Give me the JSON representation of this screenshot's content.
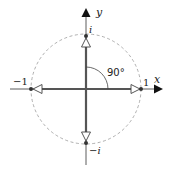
{
  "diagram": {
    "axes": {
      "x_label": "x",
      "y_label": "y"
    },
    "points": {
      "top": "i",
      "bottom": "−i",
      "left": "−1",
      "right": "1"
    },
    "angle_label": "90°",
    "colors": {
      "axis": "#222222",
      "vector": "#555555",
      "circle": "#999999",
      "point": "#333333"
    }
  }
}
